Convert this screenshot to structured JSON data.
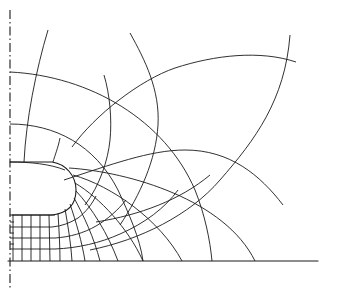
{
  "diagram": {
    "kind": "field-plot",
    "colors": {
      "background": "#ffffff",
      "line": "#1a1a1a"
    },
    "elements": {
      "symmetry_axis": "dash-dot vertical symmetry axis",
      "ground_plane": "horizontal ground/baseline",
      "electrode": "rounded electrode edge",
      "equipotential_lines": "curves crossing the field lines, ending on ground plane",
      "field_lines": "curves from the electrode/axis to the ground plane"
    },
    "text_labels": []
  }
}
